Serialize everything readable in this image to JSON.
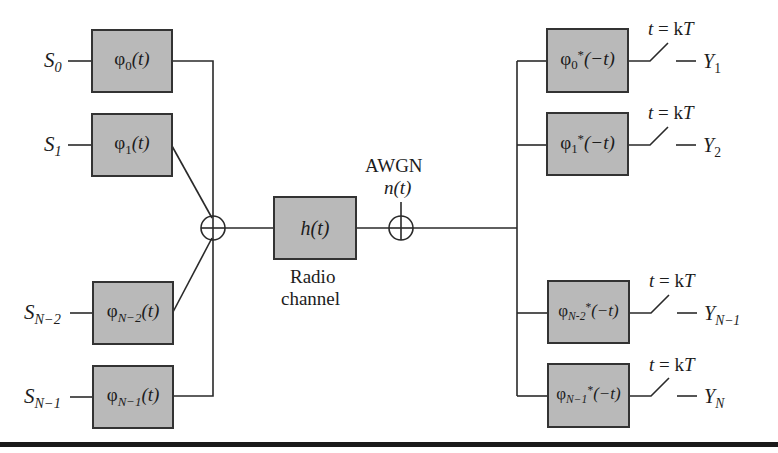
{
  "diagram": {
    "type": "block-diagram",
    "colors": {
      "box_fill": "#b9b9b9",
      "box_border": "#333333",
      "line": "#2a2a2a",
      "rule": "#1a1a1a"
    },
    "inputs": [
      {
        "symbol": "S",
        "sub": "0"
      },
      {
        "symbol": "S",
        "sub": "1"
      },
      {
        "symbol": "S",
        "sub": "N−2"
      },
      {
        "symbol": "S",
        "sub": "N−1"
      }
    ],
    "tx_filters": [
      {
        "phi": "φ",
        "sub": "0",
        "arg": "(t)"
      },
      {
        "phi": "φ",
        "sub": "1",
        "arg": "(t)"
      },
      {
        "phi": "φ",
        "sub": "N−2",
        "arg": "(t)"
      },
      {
        "phi": "φ",
        "sub": "N−1",
        "arg": "(t)"
      }
    ],
    "channel": {
      "label": "h(t)",
      "caption_line1": "Radio",
      "caption_line2": "channel"
    },
    "noise": {
      "label": "AWGN",
      "signal": "n(t)"
    },
    "rx_filters": [
      {
        "phi": "φ",
        "sub": "0",
        "sup": "*",
        "arg": "(−t)"
      },
      {
        "phi": "φ",
        "sub": "1",
        "sup": "*",
        "arg": "(−t)"
      },
      {
        "phi": "φ",
        "sub": "N-2",
        "sup": "*",
        "arg": "(−t)"
      },
      {
        "phi": "φ",
        "sub": "N−1",
        "sup": "*",
        "arg": "(−t)"
      }
    ],
    "samplers": [
      {
        "label_t": "t",
        "label_eq": " = k",
        "label_T": "T"
      },
      {
        "label_t": "t",
        "label_eq": " = k",
        "label_T": "T"
      },
      {
        "label_t": "t",
        "label_eq": " = k",
        "label_T": "T"
      },
      {
        "label_t": "t",
        "label_eq": " = k",
        "label_T": "T"
      }
    ],
    "outputs": [
      {
        "symbol": "Y",
        "sub": "1"
      },
      {
        "symbol": "Y",
        "sub": "2"
      },
      {
        "symbol": "Y",
        "sub": "N−1"
      },
      {
        "symbol": "Y",
        "sub": "N"
      }
    ]
  }
}
